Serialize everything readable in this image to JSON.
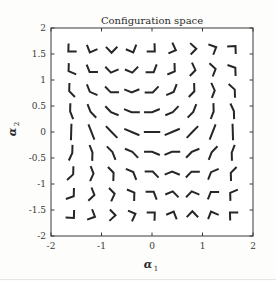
{
  "figure": {
    "title": "Configuration space",
    "background_color": "#fdfdfc",
    "axes_color": "#3a3a3a",
    "glyph_color": "#262626",
    "tick_label_color": "#3a3a3a"
  },
  "axes": {
    "x_label": "α₁",
    "y_label": "α₂",
    "x_label_base": "α",
    "x_label_sub": "1",
    "y_label_base": "α",
    "y_label_sub": "2",
    "x_ticks": [
      "-2",
      "-1",
      "0",
      "1",
      "2"
    ],
    "x_tick_values": [
      -2,
      -1,
      0,
      1,
      2
    ],
    "y_ticks": [
      "2",
      "1.5",
      "1",
      "0.5",
      "0",
      "-0.5",
      "-1",
      "-1.5",
      "-2"
    ],
    "y_tick_values": [
      2,
      1.5,
      1,
      0.5,
      0,
      -0.5,
      -1,
      -1.5,
      -2
    ],
    "xlim": [
      -2,
      2
    ],
    "ylim": [
      -2,
      2
    ],
    "grid": false,
    "box": true
  },
  "chart_data": {
    "type": "scatter",
    "title": "Configuration space",
    "xlabel": "α₁",
    "ylabel": "α₂",
    "xlim": [
      -2,
      2
    ],
    "ylim": [
      -2,
      2
    ],
    "grid": false,
    "legend": null,
    "x": [
      -1.6,
      -1.2,
      -0.8,
      -0.4,
      0,
      0.4,
      0.8,
      1.2,
      1.6
    ],
    "y": [
      -1.6,
      -1.2,
      -0.8,
      -0.4,
      0,
      0.4,
      0.8,
      1.2,
      1.6
    ],
    "marker": "two-link-arm",
    "link1_length": 0.16,
    "link2_length": 0.16,
    "n_samples": 81,
    "samples": [
      {
        "a1": -1.6,
        "a2": 1.6
      },
      {
        "a1": -1.2,
        "a2": 1.6
      },
      {
        "a1": -0.8,
        "a2": 1.6
      },
      {
        "a1": -0.4,
        "a2": 1.6
      },
      {
        "a1": 0.0,
        "a2": 1.6
      },
      {
        "a1": 0.4,
        "a2": 1.6
      },
      {
        "a1": 0.8,
        "a2": 1.6
      },
      {
        "a1": 1.2,
        "a2": 1.6
      },
      {
        "a1": 1.6,
        "a2": 1.6
      },
      {
        "a1": -1.6,
        "a2": 1.2
      },
      {
        "a1": -1.2,
        "a2": 1.2
      },
      {
        "a1": -0.8,
        "a2": 1.2
      },
      {
        "a1": -0.4,
        "a2": 1.2
      },
      {
        "a1": 0.0,
        "a2": 1.2
      },
      {
        "a1": 0.4,
        "a2": 1.2
      },
      {
        "a1": 0.8,
        "a2": 1.2
      },
      {
        "a1": 1.2,
        "a2": 1.2
      },
      {
        "a1": 1.6,
        "a2": 1.2
      },
      {
        "a1": -1.6,
        "a2": 0.8
      },
      {
        "a1": -1.2,
        "a2": 0.8
      },
      {
        "a1": -0.8,
        "a2": 0.8
      },
      {
        "a1": -0.4,
        "a2": 0.8
      },
      {
        "a1": 0.0,
        "a2": 0.8
      },
      {
        "a1": 0.4,
        "a2": 0.8
      },
      {
        "a1": 0.8,
        "a2": 0.8
      },
      {
        "a1": 1.2,
        "a2": 0.8
      },
      {
        "a1": 1.6,
        "a2": 0.8
      },
      {
        "a1": -1.6,
        "a2": 0.4
      },
      {
        "a1": -1.2,
        "a2": 0.4
      },
      {
        "a1": -0.8,
        "a2": 0.4
      },
      {
        "a1": -0.4,
        "a2": 0.4
      },
      {
        "a1": 0.0,
        "a2": 0.4
      },
      {
        "a1": 0.4,
        "a2": 0.4
      },
      {
        "a1": 0.8,
        "a2": 0.4
      },
      {
        "a1": 1.2,
        "a2": 0.4
      },
      {
        "a1": 1.6,
        "a2": 0.4
      },
      {
        "a1": -1.6,
        "a2": 0.0
      },
      {
        "a1": -1.2,
        "a2": 0.0
      },
      {
        "a1": -0.8,
        "a2": 0.0
      },
      {
        "a1": -0.4,
        "a2": 0.0
      },
      {
        "a1": 0.0,
        "a2": 0.0
      },
      {
        "a1": 0.4,
        "a2": 0.0
      },
      {
        "a1": 0.8,
        "a2": 0.0
      },
      {
        "a1": 1.2,
        "a2": 0.0
      },
      {
        "a1": 1.6,
        "a2": 0.0
      },
      {
        "a1": -1.6,
        "a2": -0.4
      },
      {
        "a1": -1.2,
        "a2": -0.4
      },
      {
        "a1": -0.8,
        "a2": -0.4
      },
      {
        "a1": -0.4,
        "a2": -0.4
      },
      {
        "a1": 0.0,
        "a2": -0.4
      },
      {
        "a1": 0.4,
        "a2": -0.4
      },
      {
        "a1": 0.8,
        "a2": -0.4
      },
      {
        "a1": 1.2,
        "a2": -0.4
      },
      {
        "a1": 1.6,
        "a2": -0.4
      },
      {
        "a1": -1.6,
        "a2": -0.8
      },
      {
        "a1": -1.2,
        "a2": -0.8
      },
      {
        "a1": -0.8,
        "a2": -0.8
      },
      {
        "a1": -0.4,
        "a2": -0.8
      },
      {
        "a1": 0.0,
        "a2": -0.8
      },
      {
        "a1": 0.4,
        "a2": -0.8
      },
      {
        "a1": 0.8,
        "a2": -0.8
      },
      {
        "a1": 1.2,
        "a2": -0.8
      },
      {
        "a1": 1.6,
        "a2": -0.8
      },
      {
        "a1": -1.6,
        "a2": -1.2
      },
      {
        "a1": -1.2,
        "a2": -1.2
      },
      {
        "a1": -0.8,
        "a2": -1.2
      },
      {
        "a1": -0.4,
        "a2": -1.2
      },
      {
        "a1": 0.0,
        "a2": -1.2
      },
      {
        "a1": 0.4,
        "a2": -1.2
      },
      {
        "a1": 0.8,
        "a2": -1.2
      },
      {
        "a1": 1.2,
        "a2": -1.2
      },
      {
        "a1": 1.6,
        "a2": -1.2
      },
      {
        "a1": -1.6,
        "a2": -1.6
      },
      {
        "a1": -1.2,
        "a2": -1.6
      },
      {
        "a1": -0.8,
        "a2": -1.6
      },
      {
        "a1": -0.4,
        "a2": -1.6
      },
      {
        "a1": 0.0,
        "a2": -1.6
      },
      {
        "a1": 0.4,
        "a2": -1.6
      },
      {
        "a1": 0.8,
        "a2": -1.6
      },
      {
        "a1": 1.2,
        "a2": -1.6
      },
      {
        "a1": 1.6,
        "a2": -1.6
      }
    ]
  }
}
